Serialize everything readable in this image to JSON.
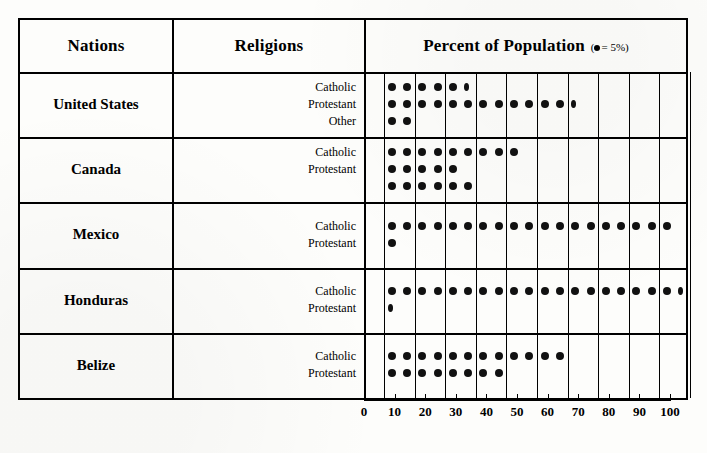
{
  "header": {
    "nations_label": "Nations",
    "religions_label": "Religions",
    "percent_label": "Percent of Population",
    "legend_prefix": "(",
    "legend_text": "= 5%)",
    "legend_icon": "filled-circle-icon"
  },
  "axis": {
    "labels": [
      "0",
      "10",
      "20",
      "30",
      "40",
      "50",
      "60",
      "70",
      "80",
      "90",
      "100"
    ],
    "min": 0,
    "max": 100,
    "step": 10,
    "dot_value": 5
  },
  "colors": {
    "ink": "#000000",
    "dot": "#111111",
    "paper": "#fdfdfb"
  },
  "chart_data": {
    "type": "bar",
    "title": "Percent of Population",
    "subtitle": "(● = 5%)",
    "xlabel": "Percent of Population",
    "ylabel": "Nations / Religions",
    "xlim": [
      0,
      100
    ],
    "grid": true,
    "legend": "none",
    "unit_per_symbol": 5,
    "categories": [
      "United States — Catholic",
      "United States — Protestant",
      "United States — Other",
      "Canada — Catholic",
      "Canada — Protestant",
      "Canada — (unlabeled)",
      "Mexico — Catholic",
      "Mexico — Protestant",
      "Honduras — Catholic",
      "Honduras — Protestant",
      "Belize — Catholic",
      "Belize — Protestant"
    ],
    "values": [
      28,
      61,
      10,
      45,
      25,
      30,
      95,
      5,
      97,
      3,
      60,
      40
    ],
    "symbol_counts": [
      6,
      13,
      2,
      9,
      5,
      6,
      19,
      1,
      20,
      1,
      12,
      8
    ]
  },
  "rows": [
    {
      "nation": "United States",
      "religions": [
        {
          "label": "Catholic",
          "percent": 28,
          "dots": 6,
          "partial": true
        },
        {
          "label": "Protestant",
          "percent": 61,
          "dots": 13,
          "partial": true
        },
        {
          "label": "Other",
          "percent": 10,
          "dots": 2,
          "partial": false
        }
      ]
    },
    {
      "nation": "Canada",
      "religions": [
        {
          "label": "Catholic",
          "percent": 45,
          "dots": 9,
          "partial": false
        },
        {
          "label": "Protestant",
          "percent": 25,
          "dots": 5,
          "partial": false
        },
        {
          "label": "",
          "percent": 30,
          "dots": 6,
          "partial": false
        }
      ]
    },
    {
      "nation": "Mexico",
      "religions": [
        {
          "label": "Catholic",
          "percent": 95,
          "dots": 19,
          "partial": false
        },
        {
          "label": "Protestant",
          "percent": 5,
          "dots": 1,
          "partial": false
        }
      ]
    },
    {
      "nation": "Honduras",
      "religions": [
        {
          "label": "Catholic",
          "percent": 97,
          "dots": 20,
          "partial": true
        },
        {
          "label": "Protestant",
          "percent": 3,
          "dots": 1,
          "partial": true
        }
      ]
    },
    {
      "nation": "Belize",
      "religions": [
        {
          "label": "Catholic",
          "percent": 60,
          "dots": 12,
          "partial": false
        },
        {
          "label": "Protestant",
          "percent": 40,
          "dots": 8,
          "partial": false
        }
      ]
    }
  ]
}
